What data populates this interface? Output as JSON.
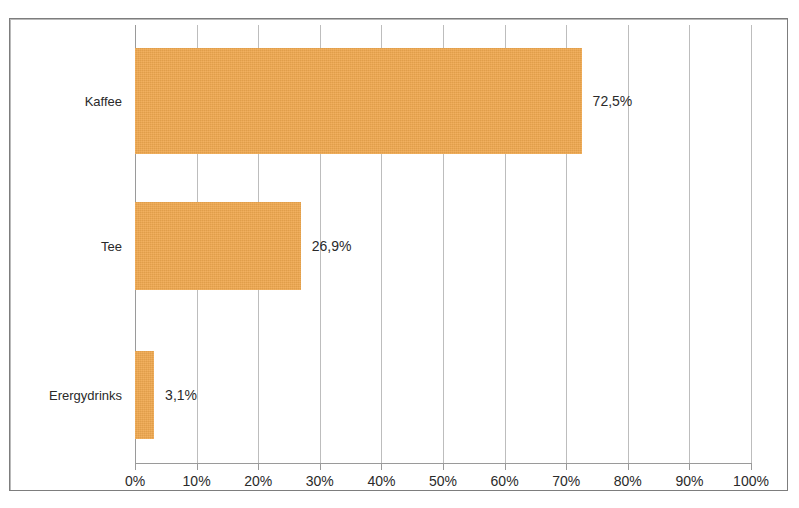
{
  "figure": {
    "clipped_top_caption": "",
    "frame_color": "#7d7d7d",
    "background": "#ffffff"
  },
  "chart_data": {
    "type": "bar",
    "orientation": "horizontal",
    "title": "",
    "subtitle": "",
    "xlabel": "",
    "ylabel": "",
    "categories": [
      "Kaffee",
      "Tee",
      "Erergydrinks"
    ],
    "values": [
      72.5,
      26.9,
      3.1
    ],
    "data_labels": [
      "72,5%",
      "26,9%",
      "3,1%"
    ],
    "xlim": [
      0,
      100
    ],
    "xticks": [
      0,
      10,
      20,
      30,
      40,
      50,
      60,
      70,
      80,
      90,
      100
    ],
    "xtick_labels": [
      "0%",
      "10%",
      "20%",
      "30%",
      "40%",
      "50%",
      "60%",
      "70%",
      "80%",
      "90%",
      "100%"
    ],
    "grid": true,
    "grid_axis": "x",
    "legend": false,
    "legend_position": "none",
    "series": [
      {
        "name": "Anteil",
        "color": "#f0a950",
        "values": [
          72.5,
          26.9,
          3.1
        ]
      }
    ],
    "colors": {
      "bar": "#f0a950",
      "gridline": "#bdbdbd",
      "axis": "#9a9a9a",
      "text": "#2a2a2a",
      "frame": "#7d7d7d"
    }
  }
}
